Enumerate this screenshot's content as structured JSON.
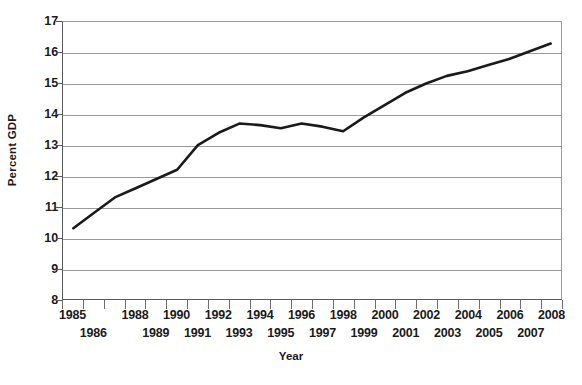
{
  "chart_data": {
    "type": "line",
    "title": "",
    "xlabel": "Year",
    "ylabel": "Percent GDP",
    "xlim": [
      1985,
      2008
    ],
    "ylim": [
      8,
      17
    ],
    "grid": true,
    "legend": "none",
    "x_tick_labels_top": [
      "1985",
      "1988",
      "1990",
      "1992",
      "1994",
      "1996",
      "1998",
      "2000",
      "2002",
      "2004",
      "2006",
      "2008"
    ],
    "x_tick_labels_bottom": [
      "1986",
      "1989",
      "1991",
      "1993",
      "1995",
      "1997",
      "1999",
      "2001",
      "2003",
      "2005",
      "2007"
    ],
    "y_tick_labels": [
      "17",
      "16",
      "15",
      "14",
      "13",
      "12",
      "11",
      "10",
      "9",
      "8"
    ],
    "y_ticks": [
      17,
      16,
      15,
      14,
      13,
      12,
      11,
      10,
      9,
      8
    ],
    "series": [
      {
        "name": "Percent GDP",
        "color": "#1a1a1a",
        "x": [
          1985,
          1986,
          1987,
          1988,
          1989,
          1990,
          1991,
          1992,
          1993,
          1994,
          1995,
          1996,
          1997,
          1998,
          1999,
          2000,
          2001,
          2002,
          2003,
          2004,
          2005,
          2006,
          2007,
          2008
        ],
        "values": [
          10.3,
          10.8,
          11.3,
          11.6,
          11.9,
          12.2,
          13.0,
          13.4,
          13.7,
          13.65,
          13.55,
          13.7,
          13.6,
          13.45,
          13.9,
          14.3,
          14.7,
          15.0,
          15.25,
          15.4,
          15.6,
          15.8,
          16.05,
          16.3
        ]
      }
    ]
  },
  "axis": {
    "y_title": "Percent GDP",
    "x_title": "Year"
  }
}
